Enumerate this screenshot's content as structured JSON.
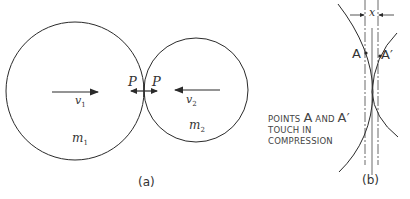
{
  "figure": {
    "panel_a": {
      "caption": "(a)",
      "mass1_label": "m",
      "mass1_sub": "1",
      "mass2_label": "m",
      "mass2_sub": "2",
      "velocity1_label": "v",
      "velocity1_sub": "1",
      "velocity2_label": "v",
      "velocity2_sub": "2",
      "force_left_label": "P",
      "force_right_label": "P"
    },
    "panel_b": {
      "caption": "(b)",
      "dimension_label": "x",
      "point_a_label": "A",
      "point_a_prime_label": "A′",
      "note_line1_pre": "POINTS ",
      "note_line1_a": "A",
      "note_line1_mid": "  AND ",
      "note_line1_ap": "A′",
      "note_line2": "TOUCH IN",
      "note_line3": "COMPRESSION"
    },
    "colors": {
      "stroke": "#2a2a2a",
      "text": "#333333"
    }
  }
}
